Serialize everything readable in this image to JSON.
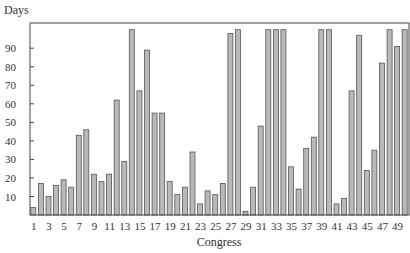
{
  "chart_data": {
    "type": "bar",
    "title": "",
    "ylabel": "Days",
    "xlabel": "Congress",
    "ylim": [
      0,
      100
    ],
    "yticks": [
      10,
      20,
      30,
      40,
      50,
      60,
      70,
      80,
      90
    ],
    "xtick_labels": [
      "1",
      "3",
      "5",
      "7",
      "9",
      "11",
      "13",
      "15",
      "17",
      "19",
      "21",
      "23",
      "25",
      "27",
      "29",
      "31",
      "33",
      "35",
      "37",
      "39",
      "41",
      "43",
      "45",
      "47",
      "49"
    ],
    "grid": false,
    "legend": null,
    "clipped_note": "Bars reaching the top border exceed the 100-day axis range",
    "categories": [
      1,
      2,
      3,
      4,
      5,
      6,
      7,
      8,
      9,
      10,
      11,
      12,
      13,
      14,
      15,
      16,
      17,
      18,
      19,
      20,
      21,
      22,
      23,
      24,
      25,
      26,
      27,
      28,
      29,
      30,
      31,
      32,
      33,
      34,
      35,
      36,
      37,
      38,
      39,
      40,
      41,
      42,
      43,
      44,
      45,
      46,
      47,
      48,
      49,
      50
    ],
    "values": [
      4,
      17,
      10,
      16,
      19,
      15,
      43,
      46,
      22,
      18,
      22,
      62,
      29,
      100,
      67,
      89,
      55,
      55,
      18,
      11,
      15,
      34,
      6,
      13,
      11,
      17,
      98,
      100,
      2,
      15,
      48,
      100,
      100,
      100,
      26,
      14,
      36,
      42,
      100,
      100,
      6,
      9,
      67,
      97,
      24,
      35,
      82,
      100,
      91,
      100
    ],
    "bar_fill": "#b9b9b9",
    "bar_stroke": "#555555"
  }
}
